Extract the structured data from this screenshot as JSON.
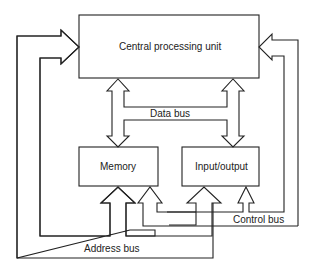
{
  "diagram": {
    "type": "block-diagram",
    "nodes": [
      {
        "id": "cpu",
        "label": "Central processing unit"
      },
      {
        "id": "memory",
        "label": "Memory"
      },
      {
        "id": "io",
        "label": "Input/output"
      }
    ],
    "buses": {
      "data": "Data bus",
      "address": "Address bus",
      "control": "Control bus"
    },
    "edges": [
      {
        "from": "cpu",
        "to": "memory",
        "bus": "Data bus",
        "direction": "bidirectional"
      },
      {
        "from": "cpu",
        "to": "io",
        "bus": "Data bus",
        "direction": "bidirectional"
      },
      {
        "from": "address-bus",
        "to": "cpu",
        "bus": "Address bus"
      },
      {
        "from": "address-bus",
        "to": "memory",
        "bus": "Address bus"
      },
      {
        "from": "address-bus",
        "to": "io",
        "bus": "Address bus"
      },
      {
        "from": "control-bus",
        "to": "cpu",
        "bus": "Control bus"
      },
      {
        "from": "control-bus",
        "to": "memory",
        "bus": "Control bus"
      },
      {
        "from": "control-bus",
        "to": "io",
        "bus": "Control bus"
      }
    ],
    "colors": {
      "stroke": "#222222",
      "background": "#ffffff"
    }
  }
}
